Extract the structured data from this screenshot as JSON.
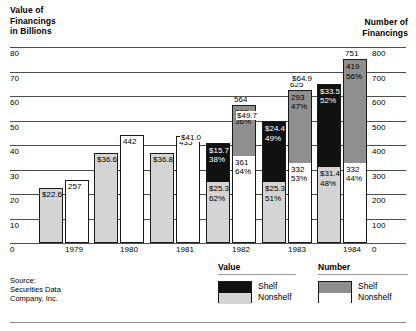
{
  "left_axis_title": "Value of\nFinancings\nin Billions",
  "right_axis_title": "Number of\nFinancings",
  "source": "Source:\nSecurities Data\nCompany, Inc.",
  "legend": {
    "value_heading": "Value",
    "number_heading": "Number",
    "shelf_label": "Shelf",
    "nonshelf_label": "Nonshelf",
    "colors": {
      "value_shelf": "#111111",
      "value_nonshelf": "#d4d4d4",
      "number_shelf": "#8f8f8f",
      "number_nonshelf": "#ffffff"
    }
  },
  "chart_data": {
    "type": "bar",
    "title": "",
    "subtitle": "",
    "xlabel": "",
    "ylabel": "Value of Financings in Billions",
    "y2label": "Number of Financings",
    "grid": true,
    "legend_position": "bottom-right",
    "categories": [
      "1979",
      "1980",
      "1981",
      "1982",
      "1983",
      "1984"
    ],
    "ylim": [
      0,
      80
    ],
    "yticks": [
      0,
      10,
      20,
      30,
      40,
      50,
      60,
      70,
      80
    ],
    "ytick_labels": [
      "0",
      "10",
      "20",
      "30",
      "40",
      "50",
      "60",
      "70",
      "80"
    ],
    "y2lim": [
      0,
      800
    ],
    "y2ticks": [
      0,
      100,
      200,
      300,
      400,
      500,
      600,
      700,
      800
    ],
    "y2tick_labels": [
      "0",
      "100",
      "200",
      "300",
      "400",
      "500",
      "600",
      "700",
      "800"
    ],
    "value_bars": {
      "axis": "left",
      "totals": [
        22.6,
        36.6,
        36.8,
        41.0,
        49.7,
        64.9
      ],
      "total_labels": [
        "$22.6",
        "$36.6",
        "$36.8",
        "$41.0",
        "$49.7",
        "$64.9"
      ],
      "series": [
        {
          "name": "Shelf",
          "values": [
            null,
            null,
            null,
            15.7,
            24.4,
            33.5
          ],
          "labels": [
            "",
            "",
            "",
            "$15.7",
            "$24.4",
            "$33.5"
          ],
          "percents": [
            "",
            "",
            "",
            "38%",
            "49%",
            "52%"
          ]
        },
        {
          "name": "Nonshelf",
          "values": [
            22.6,
            36.6,
            36.8,
            25.3,
            25.3,
            31.4
          ],
          "labels": [
            "$22.6",
            "$36.6",
            "$36.8",
            "$25.3",
            "$25.3",
            "$31.4"
          ],
          "percents": [
            "",
            "",
            "",
            "62%",
            "51%",
            "48%"
          ]
        }
      ]
    },
    "number_bars": {
      "axis": "right",
      "totals": [
        257,
        442,
        435,
        564,
        625,
        751
      ],
      "total_labels": [
        "257",
        "442",
        "435",
        "564",
        "625",
        "751"
      ],
      "series": [
        {
          "name": "Shelf",
          "values": [
            null,
            null,
            null,
            203,
            293,
            419
          ],
          "labels": [
            "",
            "",
            "",
            "203",
            "293",
            "419"
          ],
          "percents": [
            "",
            "",
            "",
            "36%",
            "47%",
            "56%"
          ]
        },
        {
          "name": "Nonshelf",
          "values": [
            257,
            442,
            435,
            361,
            332,
            332
          ],
          "labels": [
            "257",
            "442",
            "435",
            "361",
            "332",
            "332"
          ],
          "percents": [
            "",
            "",
            "",
            "64%",
            "53%",
            "44%"
          ]
        }
      ]
    }
  }
}
